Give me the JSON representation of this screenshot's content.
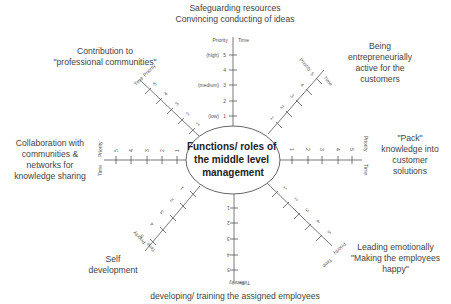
{
  "center": {
    "lines": [
      "Functions/ roles of",
      "the middle level",
      "management"
    ]
  },
  "axis_captions": {
    "priority": "Priority",
    "time": "Time"
  },
  "scale": {
    "ticks": [
      "1",
      "2",
      "3",
      "4",
      "5"
    ],
    "level_labels": {
      "high": "(high)",
      "medium": "(medium)",
      "low": "(low)"
    }
  },
  "roles": {
    "top": {
      "lines": [
        "Safeguarding resources",
        "Convincing conducting of ideas"
      ]
    },
    "top_right": {
      "lines": [
        "Being",
        "entrepreneurially",
        "active for the",
        "customers"
      ]
    },
    "right": {
      "lines": [
        "\"Pack\"",
        "knowledge into",
        "customer",
        "solutions"
      ]
    },
    "bottom_right": {
      "lines": [
        "Leading emotionally",
        "\"Making the employees",
        "happy\""
      ]
    },
    "bottom": {
      "lines": [
        "developing/ training the assigned employees"
      ]
    },
    "bottom_left": {
      "lines": [
        "Self",
        "development"
      ]
    },
    "left": {
      "lines": [
        "Collaboration with",
        "communities &",
        "networks for",
        "knowledge sharing"
      ]
    },
    "top_left": {
      "lines": [
        "Contribution to",
        "\"professional communities\""
      ]
    }
  }
}
